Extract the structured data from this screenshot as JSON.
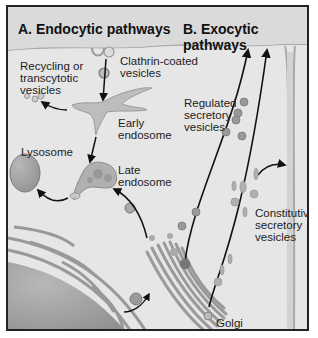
{
  "titles": {
    "a": "A. Endocytic pathways",
    "b": "B. Exocytic pathways"
  },
  "labels": {
    "recycling": [
      "Recycling or",
      "transcytotic",
      "vesicles"
    ],
    "clathrin": [
      "Clathrin-coated",
      "vesicles"
    ],
    "early": [
      "Early",
      "endosome"
    ],
    "lysosome": "Lysosome",
    "late": [
      "Late",
      "endosome"
    ],
    "regulated": [
      "Regulated",
      "secretory",
      "vesicles"
    ],
    "constitutive": [
      "Constitutive",
      "secretory",
      "vesicles"
    ],
    "golgi": "Golgi"
  },
  "colors": {
    "background": "#e6e6e6",
    "membrane": "#b0b0b0",
    "organelle": "#9a9a9a",
    "dark": "#7a7a7a",
    "arrow": "#111111",
    "border": "#222222"
  }
}
